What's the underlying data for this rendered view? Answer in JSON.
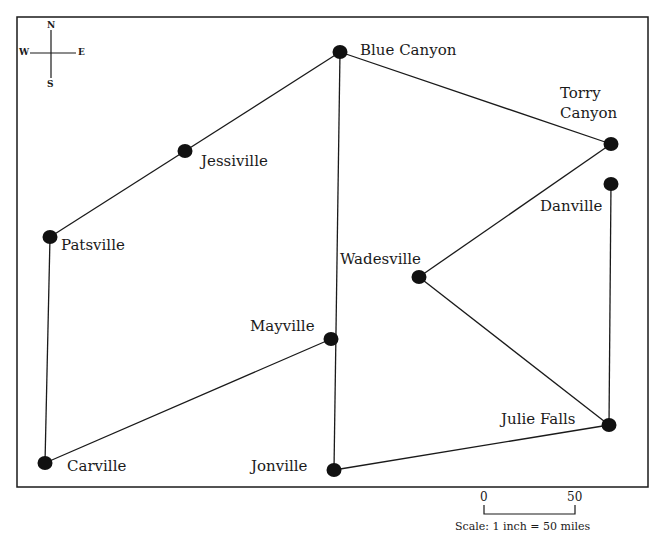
{
  "map": {
    "frame": {
      "x": 17,
      "y": 17,
      "width": 631,
      "height": 470
    },
    "line_color": "#1a1a1a",
    "node_color": "#111111",
    "compass": {
      "north": "N",
      "south": "S",
      "east": "E",
      "west": "W"
    },
    "cities": [
      {
        "id": "blue-canyon",
        "name": "Blue Canyon",
        "x": 340,
        "y": 52
      },
      {
        "id": "torry-canyon",
        "name": "Torry Canyon",
        "line1": "Torry",
        "line2": "Canyon",
        "x": 611,
        "y": 144
      },
      {
        "id": "danville",
        "name": "Danville",
        "x": 611,
        "y": 184
      },
      {
        "id": "jessiville",
        "name": "Jessiville",
        "x": 185,
        "y": 151
      },
      {
        "id": "patsville",
        "name": "Patsville",
        "x": 50,
        "y": 237
      },
      {
        "id": "wadesville",
        "name": "Wadesville",
        "x": 419,
        "y": 277
      },
      {
        "id": "mayville",
        "name": "Mayville",
        "x": 331,
        "y": 339
      },
      {
        "id": "carville",
        "name": "Carville",
        "x": 45,
        "y": 463
      },
      {
        "id": "jonville",
        "name": "Jonville",
        "x": 334,
        "y": 470
      },
      {
        "id": "julie-falls",
        "name": "Julie Falls",
        "x": 609,
        "y": 425
      }
    ],
    "roads": [
      [
        "blue-canyon",
        "jessiville"
      ],
      [
        "jessiville",
        "patsville"
      ],
      [
        "patsville",
        "carville"
      ],
      [
        "carville",
        "mayville"
      ],
      [
        "blue-canyon",
        "jonville"
      ],
      [
        "blue-canyon",
        "torry-canyon"
      ],
      [
        "torry-canyon",
        "wadesville"
      ],
      [
        "wadesville",
        "julie-falls"
      ],
      [
        "danville",
        "julie-falls"
      ],
      [
        "jonville",
        "julie-falls"
      ]
    ],
    "scale": {
      "start_label": "0",
      "end_label": "50",
      "caption": "Scale: 1 inch = 50 miles"
    }
  }
}
